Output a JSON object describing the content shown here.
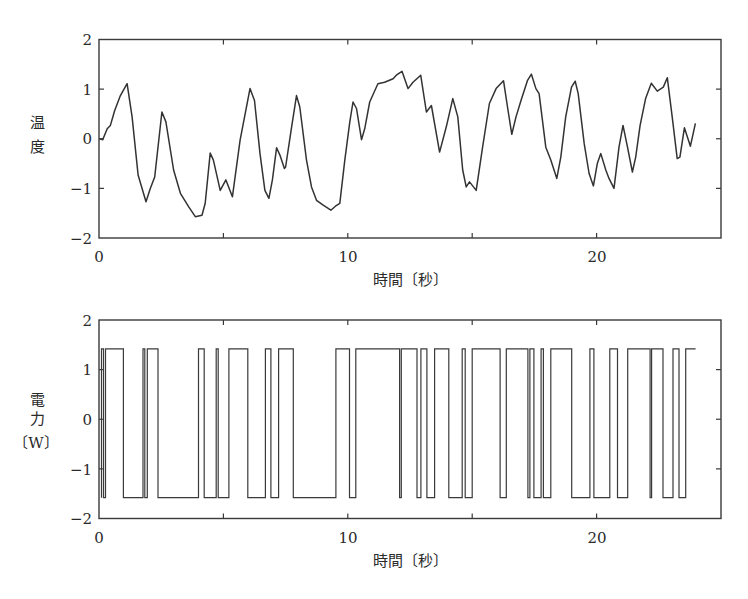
{
  "chart_data": [
    {
      "type": "line",
      "title": "",
      "xlabel": "時間〔秒〕",
      "ylabel": "温度",
      "xlim": [
        0,
        25
      ],
      "ylim": [
        -2,
        2
      ],
      "xticks": [
        0,
        10,
        20
      ],
      "xtick_labels": [
        "0",
        "10",
        "20"
      ],
      "yticks": [
        2,
        1,
        0,
        -1,
        -2
      ],
      "ytick_labels": [
        "2",
        "1",
        "0",
        "−1",
        "−2"
      ],
      "grid": false,
      "legend": null,
      "series": [
        {
          "name": "温度",
          "x": [
            0.02,
            0.15,
            0.33,
            0.46,
            0.63,
            0.86,
            1.13,
            1.33,
            1.57,
            1.89,
            2.06,
            2.24,
            2.53,
            2.69,
            3.0,
            3.27,
            3.6,
            3.87,
            4.14,
            4.27,
            4.47,
            4.6,
            4.87,
            5.1,
            5.36,
            5.67,
            6.07,
            6.25,
            6.47,
            6.67,
            6.83,
            6.97,
            7.14,
            7.27,
            7.45,
            7.5,
            7.72,
            7.94,
            8.07,
            8.34,
            8.54,
            8.74,
            9.01,
            9.32,
            9.5,
            9.68,
            9.88,
            10.08,
            10.21,
            10.35,
            10.55,
            10.68,
            10.88,
            11.21,
            11.48,
            11.82,
            11.95,
            12.18,
            12.42,
            12.62,
            12.93,
            13.16,
            13.36,
            13.69,
            13.96,
            14.22,
            14.42,
            14.62,
            14.76,
            14.89,
            15.16,
            15.42,
            15.69,
            15.96,
            16.26,
            16.42,
            16.59,
            16.76,
            16.96,
            17.22,
            17.38,
            17.56,
            17.69,
            17.96,
            18.16,
            18.4,
            18.56,
            18.76,
            18.99,
            19.14,
            19.26,
            19.5,
            19.7,
            19.87,
            20.03,
            20.17,
            20.37,
            20.5,
            20.7,
            20.9,
            21.06,
            21.24,
            21.44,
            21.57,
            21.75,
            21.97,
            22.2,
            22.44,
            22.68,
            22.84,
            23.04,
            23.24,
            23.35,
            23.53,
            23.77,
            23.97
          ],
          "y": [
            0.0,
            -0.02,
            0.2,
            0.27,
            0.57,
            0.87,
            1.11,
            0.44,
            -0.73,
            -1.27,
            -1.0,
            -0.77,
            0.54,
            0.34,
            -0.63,
            -1.1,
            -1.37,
            -1.57,
            -1.54,
            -1.3,
            -0.29,
            -0.43,
            -1.04,
            -0.83,
            -1.17,
            -0.03,
            1.01,
            0.77,
            -0.3,
            -1.04,
            -1.2,
            -0.83,
            -0.18,
            -0.33,
            -0.6,
            -0.57,
            0.17,
            0.87,
            0.64,
            -0.43,
            -0.97,
            -1.24,
            -1.34,
            -1.44,
            -1.36,
            -1.3,
            -0.43,
            0.34,
            0.74,
            0.61,
            -0.02,
            0.2,
            0.74,
            1.11,
            1.14,
            1.21,
            1.28,
            1.36,
            1.01,
            1.14,
            1.28,
            0.54,
            0.67,
            -0.27,
            0.24,
            0.81,
            0.44,
            -0.63,
            -0.97,
            -0.87,
            -1.04,
            -0.17,
            0.71,
            1.01,
            1.17,
            0.64,
            0.09,
            0.44,
            0.77,
            1.17,
            1.3,
            1.01,
            0.91,
            -0.17,
            -0.43,
            -0.8,
            -0.37,
            0.44,
            1.04,
            1.16,
            0.91,
            -0.1,
            -0.7,
            -0.95,
            -0.5,
            -0.3,
            -0.63,
            -0.8,
            -1.0,
            -0.17,
            0.27,
            -0.17,
            -0.67,
            -0.37,
            0.27,
            0.81,
            1.12,
            0.96,
            1.04,
            1.23,
            0.44,
            -0.4,
            -0.37,
            0.22,
            -0.15,
            0.31
          ]
        }
      ]
    },
    {
      "type": "line",
      "subtype": "step",
      "title": "",
      "xlabel": "時間〔秒〕",
      "ylabel": "電力〔W〕",
      "ylabel_lines": [
        "電",
        "力",
        "〔W〕"
      ],
      "xlim": [
        0,
        25
      ],
      "ylim": [
        -2,
        2
      ],
      "xticks": [
        0,
        10,
        20
      ],
      "xtick_labels": [
        "0",
        "10",
        "20"
      ],
      "yticks": [
        2,
        1,
        0,
        -1,
        -2
      ],
      "ytick_labels": [
        "2",
        "1",
        "0",
        "−1",
        "−2"
      ],
      "grid": false,
      "legend": null,
      "levels": {
        "high": 1.42,
        "low": -1.58
      },
      "series": [
        {
          "name": "電力",
          "start": 0.1,
          "end": 23.98,
          "initial_level": "high",
          "switch_times": [
            0.18,
            0.26,
            0.98,
            1.77,
            1.84,
            1.94,
            2.37,
            4.0,
            4.23,
            4.71,
            4.79,
            5.22,
            5.98,
            6.69,
            6.91,
            7.22,
            7.81,
            9.52,
            10.07,
            10.32,
            12.08,
            12.15,
            12.78,
            12.94,
            13.18,
            13.49,
            14.06,
            14.6,
            14.72,
            15.0,
            16.12,
            16.37,
            17.24,
            17.32,
            17.48,
            17.77,
            17.86,
            18.16,
            19.0,
            19.73,
            19.89,
            20.53,
            20.84,
            21.25,
            22.15,
            22.21,
            22.67,
            23.07,
            23.31,
            23.58
          ]
        }
      ]
    }
  ],
  "figure": {
    "top": {
      "ylabel_chars": [
        "温",
        "度"
      ],
      "xlabel": "時間〔秒〕"
    },
    "bottom": {
      "ylabel_chars": [
        "電",
        "力"
      ],
      "ylabel_unit": "〔W〕",
      "xlabel": "時間〔秒〕"
    }
  }
}
